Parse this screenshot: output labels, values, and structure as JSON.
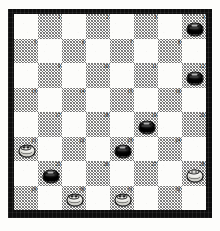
{
  "board": {
    "kind": "checkers-draughts-diagram",
    "rows": 8,
    "columns": 8,
    "playable_squares": 32,
    "numbering_origin": "top-left-dark-square",
    "colors": {
      "frame": "#0d0d0d",
      "light_square": "#fcfcfa",
      "dark_square_hatch": "#6f6f6f",
      "black_piece": "#111111",
      "white_piece": "#fbfbf7",
      "number_text": "#111111"
    },
    "squares": [
      {
        "n": 1,
        "row": 1,
        "col": 2,
        "shade": "dark",
        "piece": null
      },
      {
        "n": 2,
        "row": 1,
        "col": 4,
        "shade": "dark",
        "piece": null
      },
      {
        "n": 3,
        "row": 1,
        "col": 6,
        "shade": "dark",
        "piece": null
      },
      {
        "n": 4,
        "row": 1,
        "col": 8,
        "shade": "dark",
        "piece": "black"
      },
      {
        "n": 5,
        "row": 2,
        "col": 1,
        "shade": "dark",
        "piece": null
      },
      {
        "n": 6,
        "row": 2,
        "col": 3,
        "shade": "dark",
        "piece": null
      },
      {
        "n": 7,
        "row": 2,
        "col": 5,
        "shade": "dark",
        "piece": null
      },
      {
        "n": 8,
        "row": 2,
        "col": 7,
        "shade": "dark",
        "piece": null
      },
      {
        "n": 9,
        "row": 3,
        "col": 2,
        "shade": "dark",
        "piece": null
      },
      {
        "n": 10,
        "row": 3,
        "col": 4,
        "shade": "dark",
        "piece": null
      },
      {
        "n": 11,
        "row": 3,
        "col": 6,
        "shade": "dark",
        "piece": null
      },
      {
        "n": 12,
        "row": 3,
        "col": 8,
        "shade": "dark",
        "piece": "black"
      },
      {
        "n": 13,
        "row": 4,
        "col": 1,
        "shade": "dark",
        "piece": null
      },
      {
        "n": 14,
        "row": 4,
        "col": 3,
        "shade": "dark",
        "piece": null
      },
      {
        "n": 15,
        "row": 4,
        "col": 5,
        "shade": "dark",
        "piece": null
      },
      {
        "n": 16,
        "row": 4,
        "col": 7,
        "shade": "dark",
        "piece": null
      },
      {
        "n": 17,
        "row": 5,
        "col": 2,
        "shade": "dark",
        "piece": null
      },
      {
        "n": 18,
        "row": 5,
        "col": 4,
        "shade": "dark",
        "piece": null
      },
      {
        "n": 19,
        "row": 5,
        "col": 6,
        "shade": "dark",
        "piece": "black"
      },
      {
        "n": 20,
        "row": 5,
        "col": 8,
        "shade": "dark",
        "piece": null
      },
      {
        "n": 21,
        "row": 6,
        "col": 1,
        "shade": "dark",
        "piece": "white"
      },
      {
        "n": 22,
        "row": 6,
        "col": 3,
        "shade": "dark",
        "piece": null
      },
      {
        "n": 23,
        "row": 6,
        "col": 5,
        "shade": "dark",
        "piece": "black"
      },
      {
        "n": 24,
        "row": 6,
        "col": 7,
        "shade": "dark",
        "piece": null
      },
      {
        "n": 25,
        "row": 7,
        "col": 2,
        "shade": "dark",
        "piece": "black"
      },
      {
        "n": 26,
        "row": 7,
        "col": 4,
        "shade": "dark",
        "piece": null
      },
      {
        "n": 27,
        "row": 7,
        "col": 6,
        "shade": "dark",
        "piece": null
      },
      {
        "n": 28,
        "row": 7,
        "col": 8,
        "shade": "dark",
        "piece": "white"
      },
      {
        "n": 29,
        "row": 8,
        "col": 1,
        "shade": "dark",
        "piece": null
      },
      {
        "n": 30,
        "row": 8,
        "col": 3,
        "shade": "dark",
        "piece": "white"
      },
      {
        "n": 31,
        "row": 8,
        "col": 5,
        "shade": "dark",
        "piece": "white"
      },
      {
        "n": 32,
        "row": 8,
        "col": 7,
        "shade": "dark",
        "piece": null
      }
    ],
    "position_summary": {
      "black_squares": [
        4,
        12,
        19,
        23,
        25
      ],
      "white_squares": [
        21,
        28,
        30,
        31
      ],
      "black_count": 5,
      "white_count": 4
    }
  }
}
